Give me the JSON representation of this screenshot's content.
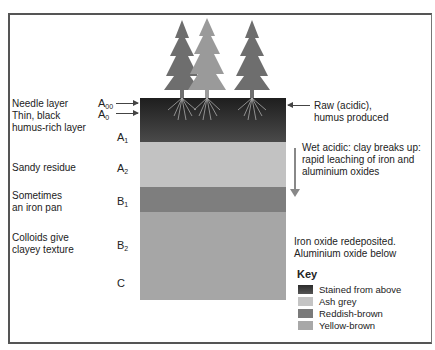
{
  "diagram": {
    "left_labels": [
      {
        "text": "Needle layer",
        "top": 98
      },
      {
        "text": "Thin, black",
        "top": 110
      },
      {
        "text": "humus-rich layer",
        "top": 122
      },
      {
        "text": "Sandy residue",
        "top": 162
      },
      {
        "text": "Sometimes",
        "top": 190
      },
      {
        "text": "an iron pan",
        "top": 202
      },
      {
        "text": "Colloids give",
        "top": 232
      },
      {
        "text": "clayey texture",
        "top": 244
      }
    ],
    "horizons": [
      {
        "letter": "A",
        "sub": "00",
        "top": 99
      },
      {
        "letter": "A",
        "sub": "0",
        "top": 109
      },
      {
        "letter": "A",
        "sub": "1",
        "top": 131
      },
      {
        "letter": "A",
        "sub": "2",
        "top": 162
      },
      {
        "letter": "B",
        "sub": "1",
        "top": 194
      },
      {
        "letter": "B",
        "sub": "2",
        "top": 238
      },
      {
        "letter": "C",
        "sub": "",
        "top": 277
      }
    ],
    "layers": [
      {
        "name": "stained-from-above",
        "top": 98,
        "height": 44,
        "color": "#3a3a3a"
      },
      {
        "name": "ash-grey",
        "top": 142,
        "height": 45,
        "color": "#c2c2c2"
      },
      {
        "name": "reddish-brown",
        "top": 187,
        "height": 25,
        "color": "#7e7e7e"
      },
      {
        "name": "yellow-brown",
        "top": 212,
        "height": 88,
        "color": "#a6a6a6"
      }
    ],
    "right_labels": {
      "raw_humus": [
        "Raw (acidic),",
        "humus produced"
      ],
      "leaching": [
        "Wet acidic: clay breaks up:",
        "rapid leaching of iron and",
        "aluminium oxides"
      ],
      "redeposit": [
        "Iron oxide redeposited.",
        "Aluminium oxide below"
      ]
    },
    "key": {
      "title": "Key",
      "items": [
        {
          "label": "Stained from above",
          "color": "#3f3f3f"
        },
        {
          "label": "Ash grey",
          "color": "#c4c4c4"
        },
        {
          "label": "Reddish-brown",
          "color": "#7a7a7a"
        },
        {
          "label": "Yellow-brown",
          "color": "#a8a8a8"
        }
      ]
    },
    "trees": [
      {
        "x": 182,
        "color": "#6e6e6e"
      },
      {
        "x": 206,
        "color": "#9a9a9a"
      },
      {
        "x": 252,
        "color": "#6e6e6e"
      }
    ]
  }
}
